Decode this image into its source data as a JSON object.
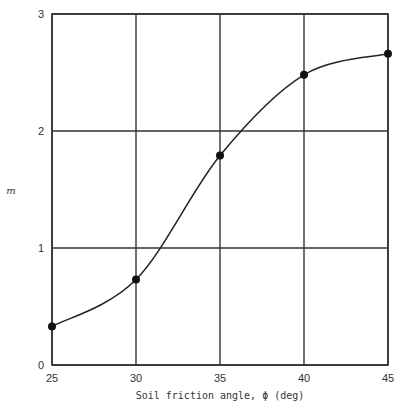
{
  "chart_data": {
    "type": "line",
    "title": "",
    "xlabel": "Soil friction angle, ϕ (deg)",
    "ylabel": "m",
    "x": [
      25,
      30,
      35,
      40,
      45
    ],
    "series": [
      {
        "name": "m",
        "values": [
          0.33,
          0.73,
          1.79,
          2.48,
          2.66
        ],
        "markers": true,
        "smooth": true
      }
    ],
    "xlim": [
      25,
      45
    ],
    "ylim": [
      0,
      3
    ],
    "xticks": [
      "25",
      "30",
      "35",
      "40",
      "45"
    ],
    "yticks": [
      "0",
      "1",
      "2",
      "3"
    ],
    "grid": true,
    "legend": null
  },
  "colors": {
    "line": "#222222",
    "grid": "#333333",
    "marker": "#111111"
  }
}
